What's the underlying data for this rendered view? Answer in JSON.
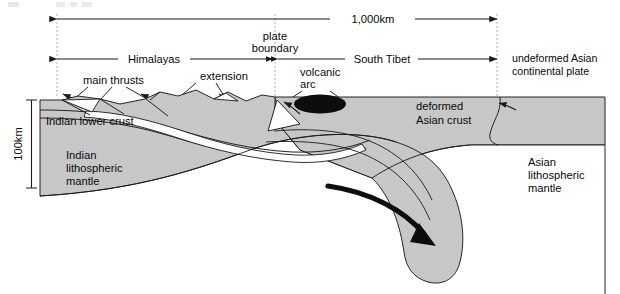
{
  "diagram": {
    "scale_bars": {
      "horizontal": {
        "label": "1,000km",
        "from_px": 57,
        "to_px": 497
      },
      "vertical": {
        "label": "100km",
        "from_px": 100,
        "to_px": 188
      }
    },
    "span_labels": {
      "himalayas": "Himalayas",
      "south_tibet": "South Tibet",
      "plate_boundary_line1": "plate",
      "plate_boundary_line2": "boundary"
    },
    "annotations": {
      "main_thrusts": "main thrusts",
      "extension": "extension",
      "volcanic_arc_line1": "volcanic",
      "volcanic_arc_line2": "arc",
      "undeformed_line1": "undeformed Asian",
      "undeformed_line2": "continental plate"
    },
    "units": {
      "indian_lower_crust": "Indian lower crust",
      "indian_lithospheric_mantle_line1": "Indian",
      "indian_lithospheric_mantle_line2": "lithospheric",
      "indian_lithospheric_mantle_line3": "mantle",
      "deformed_asian_crust_line1": "deformed",
      "deformed_asian_crust_line2": "Asian crust",
      "asian_lithospheric_mantle_line1": "Asian",
      "asian_lithospheric_mantle_line2": "lithospheric",
      "asian_lithospheric_mantle_line3": "mantle"
    },
    "colors": {
      "rock_gray": "#c9c9c9",
      "rock_gray_dark": "#bdbdbd",
      "white_fill": "#fdfdfd",
      "magma_black": "#0d0d0d",
      "line": "#1a1a1a",
      "dashed_guide": "#9a9a9a",
      "background": "#ffffff"
    }
  }
}
